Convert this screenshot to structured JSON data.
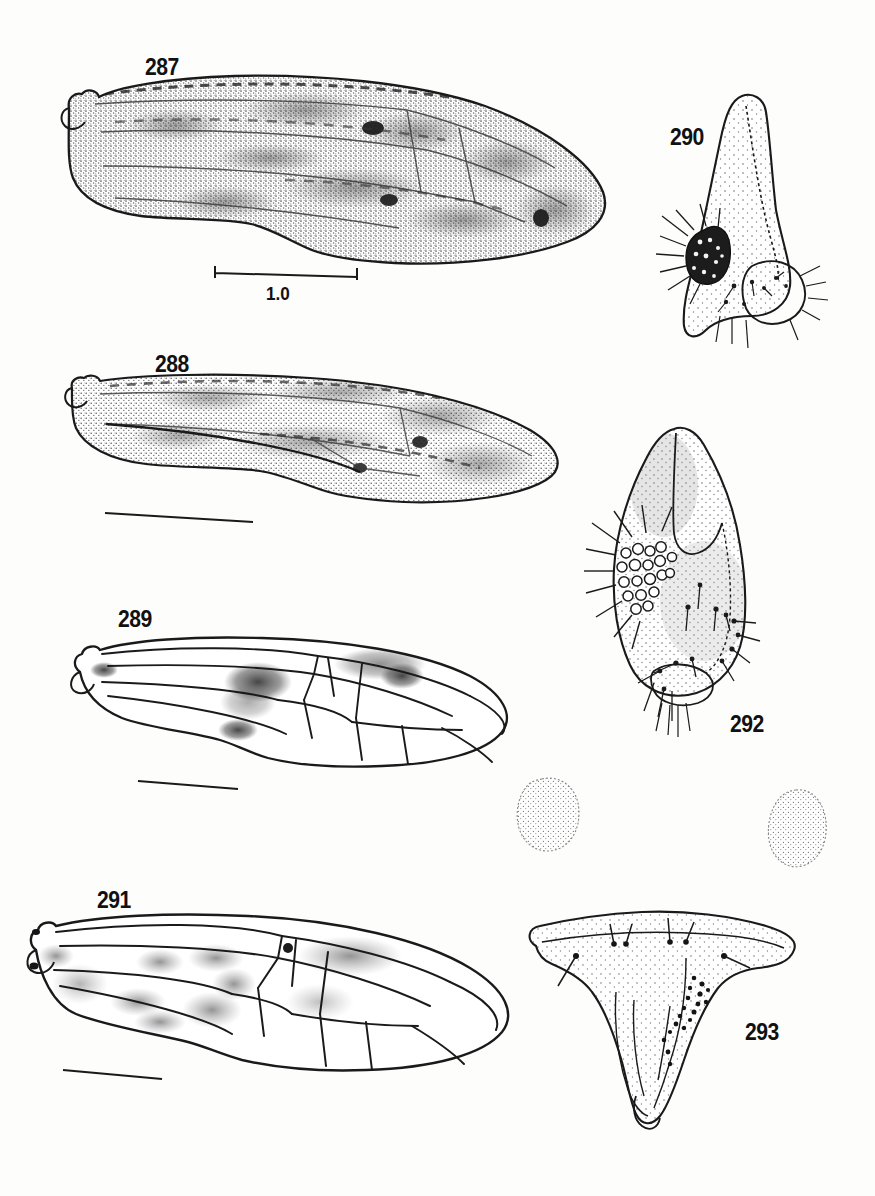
{
  "plate": {
    "title": "Plate of wings and terminalia, figures 287-293",
    "background_color": "#fdfdfc",
    "ink_color": "#1a1a1a",
    "stipple_color": "#555555",
    "width": 875,
    "height": 1196
  },
  "figures": [
    {
      "id": "fig-287",
      "label": "287",
      "label_x": 145,
      "label_y": 56,
      "subject": "forewing-heavily-maculated",
      "kind": "wing",
      "scale_bar": {
        "present": true,
        "label": "1.0",
        "label_x": 266,
        "label_y": 283,
        "x1": 215,
        "y1": 272,
        "x2": 357,
        "y2": 276,
        "ticks": true
      }
    },
    {
      "id": "fig-288",
      "label": "288",
      "label_x": 155,
      "label_y": 353,
      "subject": "forewing-maculated",
      "kind": "wing",
      "scale_bar": {
        "present": true,
        "label": "",
        "x1": 105,
        "y1": 513,
        "x2": 253,
        "y2": 522,
        "ticks": false
      }
    },
    {
      "id": "fig-289",
      "label": "289",
      "label_x": 118,
      "label_y": 608,
      "subject": "wing-venation-with-stigmal-spots",
      "kind": "wing",
      "scale_bar": {
        "present": true,
        "label": "",
        "x1": 139,
        "y1": 782,
        "x2": 236,
        "y2": 789,
        "ticks": false
      }
    },
    {
      "id": "fig-290",
      "label": "290",
      "label_x": 670,
      "label_y": 126,
      "subject": "gonostylus-with-dark-sensory-patch",
      "kind": "terminalia"
    },
    {
      "id": "fig-291",
      "label": "291",
      "label_x": 97,
      "label_y": 889,
      "subject": "wing-venation-mottled",
      "kind": "wing",
      "scale_bar": {
        "present": true,
        "label": "",
        "x1": 64,
        "y1": 1072,
        "x2": 161,
        "y2": 1079,
        "ticks": false
      }
    },
    {
      "id": "fig-292",
      "label": "292",
      "label_x": 730,
      "label_y": 713,
      "subject": "gonocoxite-with-ringed-sensilla-and-setae",
      "kind": "terminalia"
    },
    {
      "id": "fig-293",
      "label": "293",
      "label_x": 745,
      "label_y": 1021,
      "subject": "hypopygium-broad-triangular-plate",
      "kind": "terminalia"
    }
  ],
  "unlabelled_elements": [
    {
      "id": "blob-left",
      "subject": "stippled-sclerite-left",
      "x": 515,
      "y": 778,
      "w": 70,
      "h": 75
    },
    {
      "id": "blob-right",
      "subject": "stippled-sclerite-right",
      "x": 765,
      "y": 790,
      "w": 62,
      "h": 78
    }
  ]
}
